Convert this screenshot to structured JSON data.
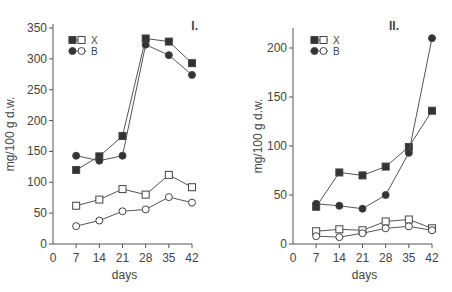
{
  "chart_data": [
    {
      "type": "line",
      "panel_label": "I.",
      "xlabel": "days",
      "ylabel": "mg/100 g d.w.",
      "x": [
        7,
        14,
        21,
        28,
        35,
        42
      ],
      "x_ticks": [
        0,
        7,
        14,
        21,
        28,
        35,
        42
      ],
      "y_ticks": [
        0,
        50,
        100,
        150,
        200,
        250,
        300,
        350
      ],
      "ylim": [
        0,
        350
      ],
      "xlim": [
        0,
        42
      ],
      "grid": false,
      "legend_position": "upper left",
      "legend": [
        {
          "label": "X",
          "markers": "filled square / open square"
        },
        {
          "label": "B",
          "markers": "filled circle / open circle"
        }
      ],
      "series": [
        {
          "name": "X (filled)",
          "marker": "filled-square",
          "values": [
            120,
            142,
            175,
            333,
            328,
            293
          ]
        },
        {
          "name": "B (filled)",
          "marker": "filled-circle",
          "values": [
            143,
            135,
            143,
            323,
            306,
            274
          ]
        },
        {
          "name": "X (open)",
          "marker": "open-square",
          "values": [
            62,
            72,
            89,
            80,
            112,
            92
          ]
        },
        {
          "name": "B (open)",
          "marker": "open-circle",
          "values": [
            29,
            38,
            53,
            56,
            76,
            67
          ]
        }
      ]
    },
    {
      "type": "line",
      "panel_label": "II.",
      "xlabel": "days",
      "ylabel": "mg/100 g d.w.",
      "x": [
        7,
        14,
        21,
        28,
        35,
        42
      ],
      "x_ticks": [
        0,
        7,
        14,
        21,
        28,
        35,
        42
      ],
      "y_ticks": [
        0,
        50,
        100,
        150,
        200
      ],
      "ylim": [
        0,
        220
      ],
      "xlim": [
        0,
        42
      ],
      "grid": false,
      "legend_position": "upper left",
      "legend": [
        {
          "label": "X",
          "markers": "filled square / open square"
        },
        {
          "label": "B",
          "markers": "filled circle / open circle"
        }
      ],
      "series": [
        {
          "name": "X (filled)",
          "marker": "filled-square",
          "values": [
            38,
            73,
            70,
            79,
            99,
            136
          ]
        },
        {
          "name": "B (filled)",
          "marker": "filled-circle",
          "values": [
            41,
            39,
            36,
            50,
            93,
            210
          ]
        },
        {
          "name": "X (open)",
          "marker": "open-square",
          "values": [
            13,
            15,
            14,
            23,
            25,
            16
          ]
        },
        {
          "name": "B (open)",
          "marker": "open-circle",
          "values": [
            8,
            7,
            11,
            16,
            18,
            14
          ]
        }
      ]
    }
  ],
  "colors": {
    "line": "#555555",
    "marker_fill": "#333333",
    "background": "#ffffff"
  }
}
